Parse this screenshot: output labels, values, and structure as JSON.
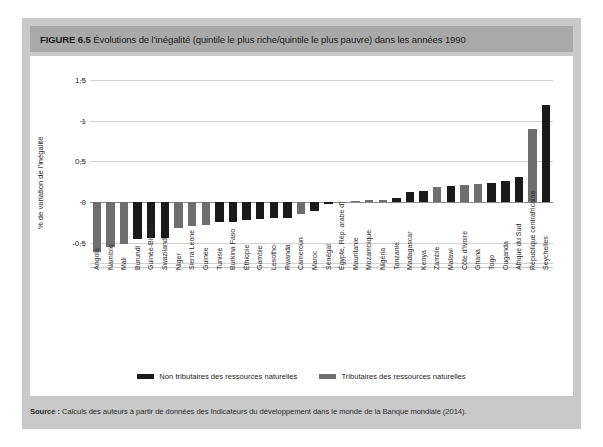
{
  "figure": {
    "label": "FIGURE",
    "number": "6.5",
    "title": "Évolutions de l’inégalité (quintile le plus riche/quintile le plus pauvre) dans les années 1990"
  },
  "source": {
    "label": "Source :",
    "text": " Calculs des auteurs à partir de données des Indicateurs du développement dans le monde de la Banque mondiale (2014)."
  },
  "legend": {
    "items": [
      {
        "label": "Non tributaires des ressources naturelles",
        "color": "#1a1a1a"
      },
      {
        "label": "Tributaires des ressources naturelles",
        "color": "#6e6e6e"
      }
    ]
  },
  "colors": {
    "non_tributary": "#1a1a1a",
    "tributary": "#6e6e6e",
    "card": "#c9c9c9",
    "titlebar": "#a9a9a9",
    "grid": "#d2d2d2",
    "zero_axis": "#8c8c8c"
  },
  "chart_data": {
    "type": "bar",
    "title": "Évolutions de l’inégalité (quintile le plus riche/quintile le plus pauvre) dans les années 1990",
    "xlabel": "",
    "ylabel": "% de variation de l’inégalité",
    "ylim": [
      -0.75,
      1.5
    ],
    "yticks": [
      1.5,
      1,
      0.5,
      0,
      -0.5
    ],
    "ytick_labels": [
      "1,5",
      "1",
      "0,5",
      "0",
      "-0,5"
    ],
    "grid": true,
    "legend_position": "bottom",
    "series_key": "group",
    "groups": {
      "non_tributary": "Non tributaires des ressources naturelles",
      "tributary": "Tributaires des ressources naturelles"
    },
    "categories": [
      "Angola",
      "Namibie",
      "Mali",
      "Burundi",
      "Guinée-Bissau",
      "Swaziland",
      "Niger",
      "Sierra Leone",
      "Guinée",
      "Tunisie",
      "Burkina Faso",
      "Éthiopie",
      "Gambie",
      "Lesotho",
      "Rwanda",
      "Cameroun",
      "Maroc",
      "Sénégal",
      "Égypte, Rép. arabe d'",
      "Mauritanie",
      "Mozambique",
      "Nigéria",
      "Tanzanie",
      "Madagascar",
      "Kenya",
      "Zambie",
      "Malawi",
      "Côte d'Ivoire",
      "Ghana",
      "Togo",
      "Ouganda",
      "Afrique du Sud",
      "République centrafricaine",
      "Seychelles"
    ],
    "values": [
      -0.61,
      -0.55,
      -0.52,
      -0.45,
      -0.44,
      -0.44,
      -0.32,
      -0.3,
      -0.28,
      -0.25,
      -0.24,
      -0.22,
      -0.21,
      -0.2,
      -0.2,
      -0.15,
      -0.11,
      -0.02,
      -0.01,
      0.01,
      0.02,
      0.03,
      0.05,
      0.12,
      0.13,
      0.18,
      0.2,
      0.21,
      0.22,
      0.23,
      0.26,
      0.31,
      0.9,
      1.19
    ],
    "group": [
      "tributary",
      "tributary",
      "tributary",
      "non_tributary",
      "non_tributary",
      "non_tributary",
      "tributary",
      "tributary",
      "tributary",
      "non_tributary",
      "non_tributary",
      "non_tributary",
      "non_tributary",
      "non_tributary",
      "non_tributary",
      "tributary",
      "non_tributary",
      "non_tributary",
      "tributary",
      "tributary",
      "tributary",
      "tributary",
      "non_tributary",
      "non_tributary",
      "non_tributary",
      "tributary",
      "non_tributary",
      "tributary",
      "tributary",
      "non_tributary",
      "non_tributary",
      "non_tributary",
      "tributary",
      "non_tributary"
    ]
  }
}
